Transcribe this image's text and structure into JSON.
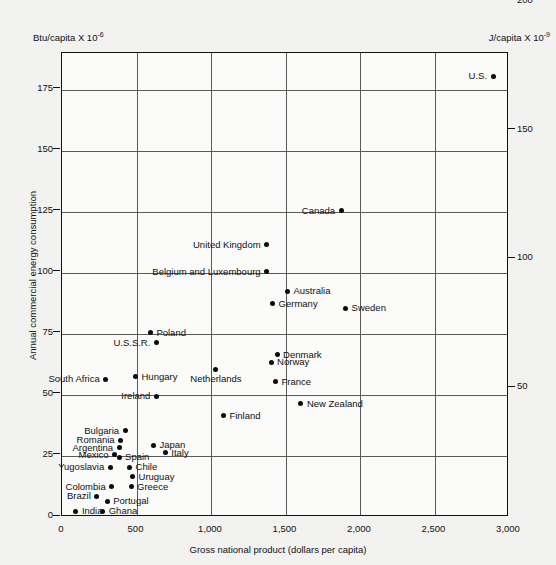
{
  "chart_data": {
    "type": "scatter",
    "title": "",
    "xlabel": "Gross national product (dollars per capita)",
    "ylabel": "Annual commercial energy consumption",
    "left_unit": "Btu/capita X 10",
    "left_unit_exp": "-6",
    "right_unit": "J/capita X 10",
    "right_unit_exp": "-9",
    "xlim": [
      0,
      3000
    ],
    "ylim": [
      0,
      190
    ],
    "xticks": [
      "0",
      "500",
      "1,000",
      "1,500",
      "2,000",
      "2,500",
      "3,000"
    ],
    "xtick_values": [
      0,
      500,
      1000,
      1500,
      2000,
      2500,
      3000
    ],
    "yticks_left": [
      "0",
      "25",
      "50",
      "75",
      "100",
      "125",
      "150",
      "175"
    ],
    "ytick_left_values": [
      0,
      25,
      50,
      75,
      100,
      125,
      150,
      175
    ],
    "yticks_right": [
      "50",
      "100",
      "150",
      "200"
    ],
    "ytick_right_values": [
      52.75,
      105.5,
      158.2,
      211.0
    ],
    "grid": true,
    "grid_x_values": [
      500,
      1000,
      1500,
      2000,
      2500
    ],
    "grid_y_values": [
      25,
      50,
      75,
      100,
      125,
      150,
      175
    ],
    "legend": "none",
    "points": [
      {
        "name": "U.S.",
        "x": 2900,
        "y": 180,
        "side": "left"
      },
      {
        "name": "Canada",
        "x": 1880,
        "y": 125,
        "side": "left"
      },
      {
        "name": "United Kingdom",
        "x": 1380,
        "y": 111,
        "side": "left"
      },
      {
        "name": "Belgium and Luxembourg",
        "x": 1380,
        "y": 100,
        "side": "left"
      },
      {
        "name": "Australia",
        "x": 1520,
        "y": 92,
        "side": "right"
      },
      {
        "name": "Germany",
        "x": 1420,
        "y": 87,
        "side": "right"
      },
      {
        "name": "Sweden",
        "x": 1910,
        "y": 85,
        "side": "right"
      },
      {
        "name": "Poland",
        "x": 600,
        "y": 75,
        "side": "right"
      },
      {
        "name": "U.S.S.R.",
        "x": 640,
        "y": 71,
        "side": "left"
      },
      {
        "name": "Denmark",
        "x": 1450,
        "y": 66,
        "side": "right"
      },
      {
        "name": "Norway",
        "x": 1410,
        "y": 63,
        "side": "right"
      },
      {
        "name": "Netherlands",
        "x": 1040,
        "y": 60,
        "side": "below"
      },
      {
        "name": "France",
        "x": 1440,
        "y": 55,
        "side": "right"
      },
      {
        "name": "Hungary",
        "x": 500,
        "y": 57,
        "side": "right"
      },
      {
        "name": "South Africa",
        "x": 300,
        "y": 56,
        "side": "left"
      },
      {
        "name": "Ireland",
        "x": 640,
        "y": 49,
        "side": "left"
      },
      {
        "name": "New Zealand",
        "x": 1610,
        "y": 46,
        "side": "right"
      },
      {
        "name": "Finland",
        "x": 1090,
        "y": 41,
        "side": "right"
      },
      {
        "name": "Bulgaria",
        "x": 430,
        "y": 35,
        "side": "left"
      },
      {
        "name": "Romania",
        "x": 400,
        "y": 31,
        "side": "left"
      },
      {
        "name": "Argentina",
        "x": 390,
        "y": 28,
        "side": "left"
      },
      {
        "name": "Japan",
        "x": 620,
        "y": 29,
        "side": "right"
      },
      {
        "name": "Italy",
        "x": 700,
        "y": 26,
        "side": "right"
      },
      {
        "name": "Mexico",
        "x": 360,
        "y": 25,
        "side": "left"
      },
      {
        "name": "Spain",
        "x": 390,
        "y": 24,
        "side": "right"
      },
      {
        "name": "Yugoslavia",
        "x": 330,
        "y": 20,
        "side": "left"
      },
      {
        "name": "Chile",
        "x": 460,
        "y": 20,
        "side": "right"
      },
      {
        "name": "Uruguay",
        "x": 480,
        "y": 16,
        "side": "right"
      },
      {
        "name": "Colombia",
        "x": 340,
        "y": 12,
        "side": "left"
      },
      {
        "name": "Greece",
        "x": 470,
        "y": 12,
        "side": "right"
      },
      {
        "name": "Brazil",
        "x": 240,
        "y": 8,
        "side": "left"
      },
      {
        "name": "Portugal",
        "x": 310,
        "y": 6,
        "side": "right"
      },
      {
        "name": "India",
        "x": 100,
        "y": 2,
        "side": "right"
      },
      {
        "name": "Ghana",
        "x": 280,
        "y": 2,
        "side": "right"
      }
    ]
  }
}
